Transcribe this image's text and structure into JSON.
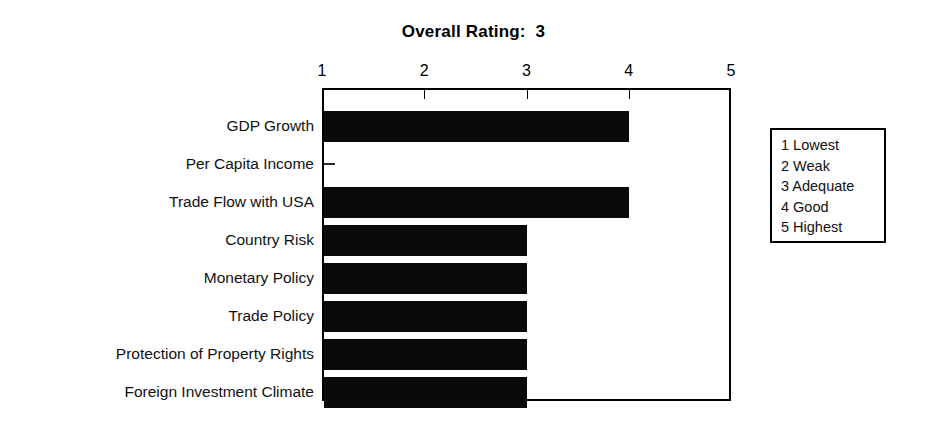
{
  "chart_data": {
    "type": "bar",
    "orientation": "horizontal",
    "title": "Overall Rating:  3",
    "xlabel": "",
    "ylabel": "",
    "xlim": [
      1,
      5
    ],
    "grid": false,
    "legend_position": "right",
    "categories": [
      "GDP Growth",
      "Per Capita Income",
      "Trade Flow with USA",
      "Country Risk",
      "Monetary Policy",
      "Trade Policy",
      "Protection of Property Rights",
      "Foreign Investment Climate"
    ],
    "values": [
      4,
      1,
      4,
      3,
      3,
      3,
      3,
      3
    ],
    "xticks": [
      "1",
      "2",
      "3",
      "4",
      "5"
    ],
    "bar_color": "#0a0a0a",
    "annotations": [
      "Overall Rating:  3"
    ]
  },
  "title": {
    "text": "Overall Rating:  3"
  },
  "axis": {
    "ticks": [
      {
        "label": "1",
        "value": 1
      },
      {
        "label": "2",
        "value": 2
      },
      {
        "label": "3",
        "value": 3
      },
      {
        "label": "4",
        "value": 4
      },
      {
        "label": "5",
        "value": 5
      }
    ]
  },
  "bars": [
    {
      "label": "GDP Growth",
      "value": 4
    },
    {
      "label": "Per Capita Income",
      "value": 1
    },
    {
      "label": "Trade Flow with USA",
      "value": 4
    },
    {
      "label": "Country Risk",
      "value": 3
    },
    {
      "label": "Monetary Policy",
      "value": 3
    },
    {
      "label": "Trade Policy",
      "value": 3
    },
    {
      "label": "Protection of Property Rights",
      "value": 3
    },
    {
      "label": "Foreign Investment Climate",
      "value": 3
    }
  ],
  "legend": {
    "items": [
      "1 Lowest",
      "2 Weak",
      "3 Adequate",
      "4 Good",
      "5 Highest"
    ]
  },
  "colors": {
    "bar": "#0a0a0a",
    "frame": "#000000",
    "background": "#ffffff",
    "text": "#111111"
  }
}
